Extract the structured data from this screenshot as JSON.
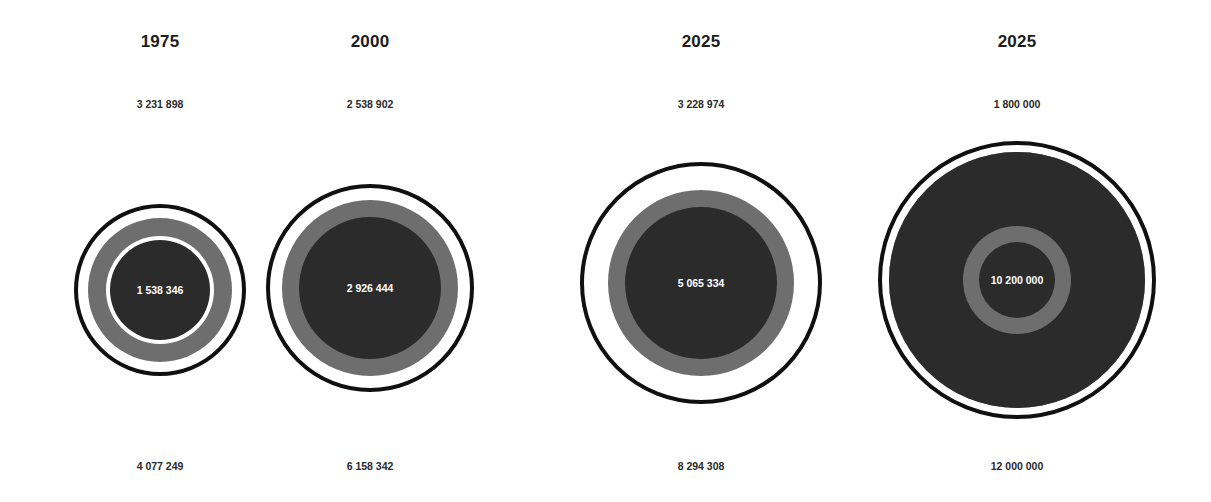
{
  "chart_data": {
    "type": "bar",
    "title": "",
    "subtitle": "",
    "xlabel": "",
    "ylabel": "",
    "legend_position": "none",
    "grid": false,
    "encoding": "nested concentric circles; area proportional to value",
    "categories": [
      "1975",
      "2000",
      "2025",
      "2025"
    ],
    "series": [
      {
        "name": "top",
        "values": [
          3231898,
          2538902,
          3228974,
          1800000
        ]
      },
      {
        "name": "center",
        "values": [
          1538346,
          2926444,
          5065334,
          10200000
        ]
      },
      {
        "name": "bottom",
        "values": [
          4077249,
          6158342,
          8294308,
          12000000
        ]
      }
    ],
    "annotations": [
      "3 231 898",
      "2 538 902",
      "3 228 974",
      "1 800 000",
      "1 538 346",
      "2 926 444",
      "5 065 334",
      "10 200 000",
      "4 077 249",
      "6 158 342",
      "8 294 308",
      "12 000 000"
    ]
  },
  "colors": {
    "background": "#ffffff",
    "outline": "#101010",
    "mid_ring": "#6e6e6e",
    "inner_disc": "#2b2b2b",
    "label_text": "#1c1c1c",
    "value_text": "#2a2a2a",
    "center_text": "#ffffff"
  },
  "columns": [
    {
      "id": "col-1975",
      "year": "1975",
      "top_value": "3 231 898",
      "center_value": "1 538 346",
      "bottom_value": "4 077 249",
      "left": 48,
      "width": 224,
      "center_y": 290,
      "outer_d": 172,
      "white_gap_d": 152,
      "mid_d": 144,
      "inner_white_d": 108,
      "inner_d": 100
    },
    {
      "id": "col-2000",
      "year": "2000",
      "top_value": "2 538 902",
      "center_value": "2 926 444",
      "bottom_value": "6 158 342",
      "left": 252,
      "width": 236,
      "center_y": 288,
      "outer_d": 208,
      "white_gap_d": 186,
      "mid_d": 176,
      "inner_white_d": 142,
      "inner_d": 142
    },
    {
      "id": "col-2025-a",
      "year": "2025",
      "top_value": "3 228 974",
      "center_value": "5 065 334",
      "bottom_value": "8 294 308",
      "left": 578,
      "width": 246,
      "center_y": 283,
      "outer_d": 242,
      "white_gap_d": 224,
      "mid_d": 186,
      "inner_white_d": 152,
      "inner_d": 152
    },
    {
      "id": "col-2025-b",
      "year": "2025",
      "top_value": "1 800 000",
      "center_value": "10 200 000",
      "bottom_value": "12 000 000",
      "left": 888,
      "width": 258,
      "center_y": 280,
      "outer_d": 278,
      "white_gap_d": 262,
      "mid_d": 256,
      "inner_white_d": 256,
      "inner_d": 256,
      "core_ring_d": 108,
      "core_inner_d": 76
    }
  ]
}
